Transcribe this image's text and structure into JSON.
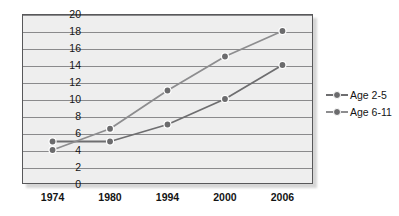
{
  "chart_data": {
    "type": "line",
    "title": "",
    "xlabel": "",
    "ylabel": "",
    "categories": [
      "1974",
      "1980",
      "1994",
      "2000",
      "2006"
    ],
    "ylim": [
      0,
      20
    ],
    "ytick_step": 2,
    "yticks": [
      "20",
      "18",
      "16",
      "14",
      "12",
      "10",
      "8",
      "6",
      "4",
      "2",
      "0"
    ],
    "grid": true,
    "legend_position": "right",
    "series": [
      {
        "name": "Age 2-5",
        "color": "#6e6e70",
        "values": [
          5,
          5,
          7,
          10,
          14
        ]
      },
      {
        "name": "Age 6-11",
        "color": "#8d8d8f",
        "values": [
          4,
          6.5,
          11,
          15,
          18
        ]
      }
    ]
  },
  "legend": {
    "items": [
      {
        "label": "Age 2-5"
      },
      {
        "label": "Age 6-11"
      }
    ]
  },
  "colors": {
    "plot_background": "#eeeeee",
    "frame": "#58585a",
    "gridline": "#8a8a8c",
    "marker_fill": "#6b6b6d",
    "marker_ring": "#ffffff",
    "text": "#141414"
  }
}
